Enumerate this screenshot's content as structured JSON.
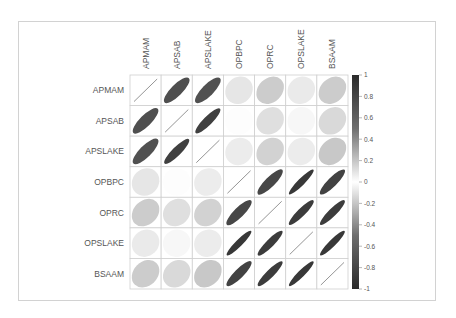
{
  "chart_data": {
    "type": "heatmap",
    "subtype": "correlation-ellipse-matrix",
    "title": "",
    "variables": [
      "APMAM",
      "APSAB",
      "APSLAKE",
      "OPBPC",
      "OPRC",
      "OPSLAKE",
      "BSAAM"
    ],
    "matrix": [
      [
        1.0,
        0.83,
        0.82,
        0.12,
        0.24,
        0.1,
        0.24
      ],
      [
        0.83,
        1.0,
        0.9,
        0.01,
        0.15,
        0.04,
        0.18
      ],
      [
        0.82,
        0.9,
        1.0,
        0.09,
        0.21,
        0.09,
        0.26
      ],
      [
        0.12,
        0.01,
        0.09,
        1.0,
        0.87,
        0.94,
        0.89
      ],
      [
        0.24,
        0.15,
        0.21,
        0.87,
        1.0,
        0.92,
        0.92
      ],
      [
        0.1,
        0.04,
        0.09,
        0.94,
        0.92,
        1.0,
        0.94
      ],
      [
        0.24,
        0.18,
        0.26,
        0.89,
        0.92,
        0.94,
        1.0
      ]
    ],
    "colorbar": {
      "range": [
        -1,
        1
      ],
      "tick_labels": [
        "1",
        "0.8",
        "0.6",
        "0.4",
        "0.2",
        "0",
        "-0.2",
        "-0.4",
        "-0.6",
        "-0.8",
        "-1"
      ],
      "tick_values": [
        1,
        0.8,
        0.6,
        0.4,
        0.2,
        0,
        -0.2,
        -0.4,
        -0.6,
        -0.8,
        -1
      ],
      "colors": {
        "negative_end": "#2b2b2b",
        "zero": "#ffffff",
        "positive_end": "#2b2b2b"
      },
      "placement": "right"
    },
    "x_labels_position": "top, rotated",
    "y_labels_position": "left",
    "grid": true
  }
}
